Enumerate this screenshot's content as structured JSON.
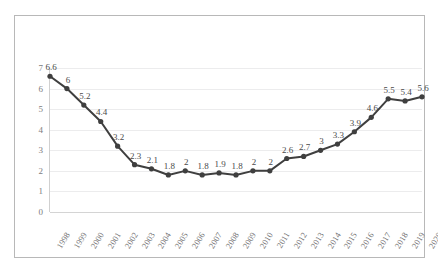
{
  "chart_data": {
    "type": "line",
    "title": "",
    "xlabel": "",
    "ylabel": "",
    "ylim": [
      0,
      7
    ],
    "yticks": [
      "0",
      "1",
      "2",
      "3",
      "4",
      "5",
      "6",
      "7"
    ],
    "grid": true,
    "legend": "none",
    "series_color": "#3f3f3f",
    "marker": "circle",
    "data_labels": true,
    "categories": [
      "1998",
      "1999",
      "2000",
      "2001",
      "2002",
      "2003",
      "2004",
      "2005",
      "2006",
      "2007",
      "2008",
      "2009",
      "2010",
      "2011",
      "2012",
      "2013",
      "2014",
      "2015",
      "2016",
      "2017",
      "2018",
      "2019",
      "2020"
    ],
    "values": [
      6.6,
      6,
      5.2,
      4.4,
      3.2,
      2.3,
      2.1,
      1.8,
      2,
      1.8,
      1.9,
      1.8,
      2,
      2,
      2.6,
      2.7,
      3,
      3.3,
      3.9,
      4.6,
      5.5,
      5.4,
      5.6
    ],
    "value_labels": [
      "6.6",
      "6",
      "5.2",
      "4.4",
      "3.2",
      "2.3",
      "2.1",
      "1.8",
      "2",
      "1.8",
      "1.9",
      "1.8",
      "2",
      "2",
      "2.6",
      "2.7",
      "3",
      "3.3",
      "3.9",
      "4.6",
      "5.5",
      "5.4",
      "5.6"
    ]
  }
}
